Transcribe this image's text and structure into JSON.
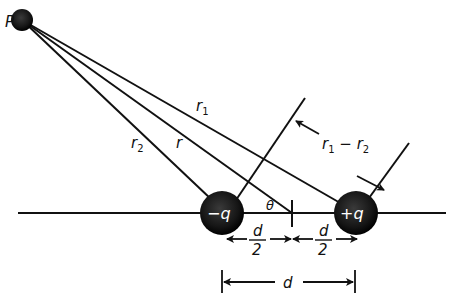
{
  "diagram": {
    "point": {
      "label": "P"
    },
    "charges": [
      {
        "id": "negative",
        "label": "−q"
      },
      {
        "id": "positive",
        "label": "+q"
      }
    ],
    "distances": {
      "r": "r",
      "r1": "r",
      "r1_sub": "1",
      "r2": "r",
      "r2_sub": "2",
      "difference_r1": "r",
      "difference_sub1": "1",
      "difference_minus": " − ",
      "difference_r2": "r",
      "difference_sub2": "2"
    },
    "angle": {
      "label": "θ"
    },
    "spacing": {
      "half_numerator": "d",
      "half_denominator": "2",
      "full": "d"
    },
    "colors": {
      "line": "#111111",
      "charge_fill": "#1a1a1a",
      "charge_text": "#ffffff",
      "background": "#ffffff"
    }
  }
}
